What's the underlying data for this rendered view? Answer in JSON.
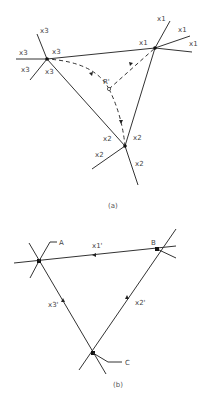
{
  "figure_a": {
    "caption": "(a)",
    "nodes": {
      "x1": {
        "label": "x1"
      },
      "x2": {
        "label": "x2"
      },
      "x3": {
        "label": "x3"
      }
    },
    "center_label": "R'",
    "labels": {
      "x3_top": "x3",
      "x3_left": "x3",
      "x3_right": "x3",
      "x3_lower_left": "x3",
      "x3_lower": "x3",
      "x1_top": "x1",
      "x1_right_upper": "x1",
      "x1_right": "x1",
      "x1_left": "x1",
      "x2_left_upper": "x2",
      "x2_right": "x2",
      "x2_left": "x2",
      "x2_lower": "x2"
    }
  },
  "figure_b": {
    "caption": "(b)",
    "nodes": {
      "A": {
        "label": "A"
      },
      "B": {
        "label": "B"
      },
      "C": {
        "label": "C"
      }
    },
    "edge_labels": {
      "AB": "x1'",
      "BC": "x2'",
      "CA": "x3'"
    }
  }
}
